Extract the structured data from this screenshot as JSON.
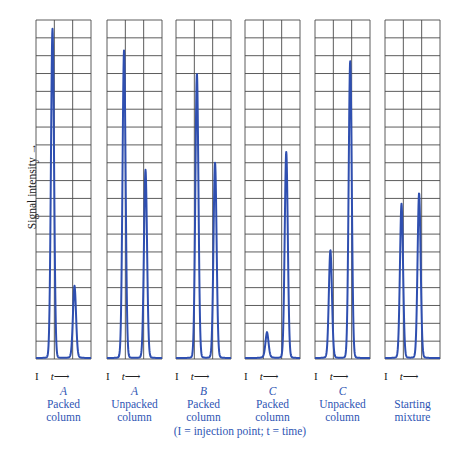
{
  "chart_data": {
    "type": "line",
    "title": "",
    "ylabel": "Signal intensity",
    "xlabel": "t (time)",
    "grid": true,
    "grid_rows": 19,
    "grid_cols": 3,
    "ylim": [
      0,
      19
    ],
    "footnote": "(I = injection point; t = time)",
    "panels": [
      {
        "letter": "A",
        "label": "Packed column",
        "peaks": [
          {
            "x": 0.3,
            "height": 18.2
          },
          {
            "x": 0.7,
            "height": 3.8
          }
        ]
      },
      {
        "letter": "A",
        "label": "Unpacked column",
        "peaks": [
          {
            "x": 0.31,
            "height": 17.0
          },
          {
            "x": 0.7,
            "height": 10.3
          }
        ]
      },
      {
        "letter": "B",
        "label": "Packed column",
        "peaks": [
          {
            "x": 0.38,
            "height": 15.7
          },
          {
            "x": 0.71,
            "height": 10.7
          }
        ]
      },
      {
        "letter": "C",
        "label": "Packed column",
        "peaks": [
          {
            "x": 0.4,
            "height": 1.2
          },
          {
            "x": 0.75,
            "height": 11.3
          }
        ]
      },
      {
        "letter": "C",
        "label": "Unpacked column",
        "peaks": [
          {
            "x": 0.28,
            "height": 5.8
          },
          {
            "x": 0.64,
            "height": 16.4
          }
        ]
      },
      {
        "letter": "",
        "label": "Starting mixture",
        "peaks": [
          {
            "x": 0.3,
            "height": 8.4
          },
          {
            "x": 0.62,
            "height": 9.0
          }
        ]
      }
    ]
  },
  "axis": {
    "ylabel": "Signal intensity",
    "injection_mark": "I",
    "time_mark": "t"
  },
  "captions": [
    {
      "letter": "A",
      "line1": "Packed",
      "line2": "column"
    },
    {
      "letter": "A",
      "line1": "Unpacked",
      "line2": "column"
    },
    {
      "letter": "B",
      "line1": "Packed",
      "line2": "column"
    },
    {
      "letter": "C",
      "line1": "Packed",
      "line2": "column"
    },
    {
      "letter": "C",
      "line1": "Unpacked",
      "line2": "column"
    },
    {
      "letter": "",
      "line1": "Starting",
      "line2": "mixture"
    }
  ],
  "footnote": "(I = injection point; t = time)",
  "colors": {
    "trace": "#2f4fb0",
    "grid": "#4a4a4a",
    "caption": "#2f56b4"
  }
}
